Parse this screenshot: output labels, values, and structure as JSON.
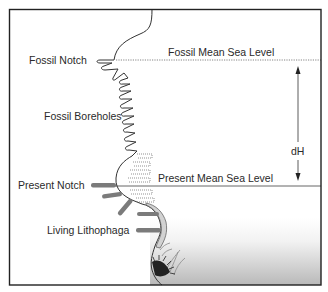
{
  "diagram": {
    "labels": {
      "fossil_notch": "Fossil Notch",
      "fossil_boreholes": "Fossil Boreholes",
      "present_notch": "Present Notch",
      "living_lithophaga": "Living Lithophaga",
      "fossil_msl": "Fossil Mean Sea Level",
      "present_msl": "Present Mean Sea Level",
      "dh": "dH"
    },
    "colors": {
      "frame": "#222222",
      "line": "#333333",
      "lithophaga": "#7a7a7a",
      "shell_fill": "#d4d4d4",
      "sea_top": "#ffffff",
      "sea_bottom": "#bdbdbd"
    }
  }
}
